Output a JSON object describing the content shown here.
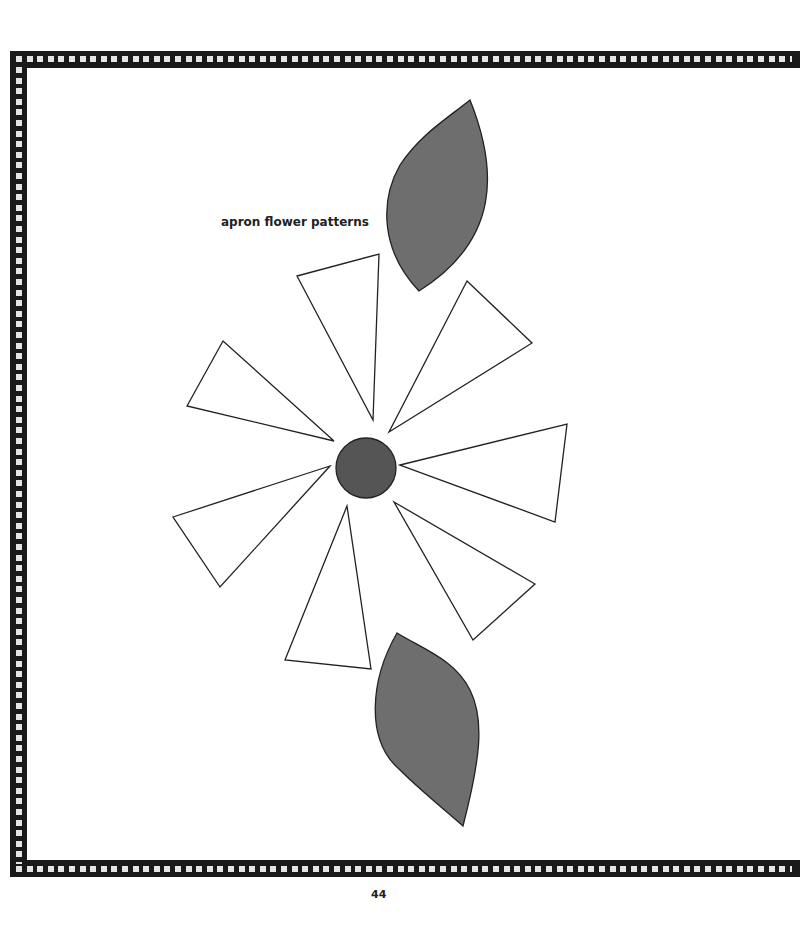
{
  "page": {
    "title": "apron flower patterns",
    "page_number": "44"
  },
  "colors": {
    "border": "#1a1a1a",
    "border_dots": "#e6e6e6",
    "leaf_fill": "#6e6e6e",
    "center_fill": "#555555",
    "outline": "#222222",
    "petal_fill": "#ffffff"
  },
  "pattern_pieces": {
    "leaves": [
      {
        "name": "leaf-top"
      },
      {
        "name": "leaf-bottom"
      }
    ],
    "petals_count": 7,
    "center": {
      "name": "flower-center",
      "shape": "circle"
    }
  }
}
